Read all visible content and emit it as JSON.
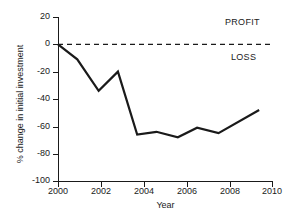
{
  "chart_data": {
    "type": "line",
    "title": "",
    "xlabel": "Year",
    "ylabel": "% change in initial investment",
    "xlim": [
      2000,
      2010
    ],
    "ylim": [
      -100,
      20
    ],
    "grid": false,
    "legend": "none",
    "xticks": [
      "2000",
      "2002",
      "2004",
      "2006",
      "2008",
      "2010"
    ],
    "xtick_values": [
      2000,
      2002,
      2004,
      2006,
      2008,
      2010
    ],
    "yticks": [
      "20",
      "0",
      "-20",
      "-40",
      "-60",
      "-80",
      "-100"
    ],
    "ytick_values": [
      20,
      0,
      -20,
      -40,
      -60,
      -80,
      -100
    ],
    "series": [
      {
        "name": "% change in initial investment",
        "color": "#1a1a1a",
        "x": [
          2000.0,
          2000.9,
          2001.9,
          2002.8,
          2003.7,
          2004.6,
          2005.6,
          2006.5,
          2007.5,
          2009.4
        ],
        "values": [
          0,
          -11,
          -34,
          -20,
          -66,
          -64,
          -68,
          -61,
          -65,
          -48
        ]
      }
    ],
    "reference_lines": [
      {
        "name": "zero-line",
        "y": 0,
        "style": "dashed",
        "color": "#1a1a1a"
      }
    ],
    "annotations": [
      {
        "name": "profit",
        "text": "PROFIT",
        "x": 2009.3,
        "y": 14
      },
      {
        "name": "loss",
        "text": "LOSS",
        "x": 2009.3,
        "y": -5
      }
    ]
  }
}
